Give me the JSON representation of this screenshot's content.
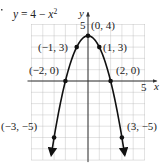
{
  "chart_data": {
    "type": "line",
    "equation": {
      "lhs": "y",
      "rhs_const": "4",
      "rhs_var": "x",
      "rhs_exp": "2"
    },
    "xlabel": "x",
    "ylabel": "y",
    "xlim": [
      -5,
      5
    ],
    "ylim": [
      -7,
      5
    ],
    "grid": true,
    "x_tick_label": "5",
    "y_tick_label": "5",
    "series": [
      {
        "name": "y = 4 − x²",
        "function": "4 - x^2",
        "domain": [
          -3.25,
          3.25
        ],
        "arrows_both_ends": true,
        "points": [
          {
            "x": -3,
            "y": -5,
            "label": "(−3, −5)"
          },
          {
            "x": -2,
            "y": 0,
            "label": "(−2, 0)"
          },
          {
            "x": -1,
            "y": 3,
            "label": "(−1, 3)"
          },
          {
            "x": 0,
            "y": 4,
            "label": "(0, 4)"
          },
          {
            "x": 1,
            "y": 3,
            "label": "(1, 3)"
          },
          {
            "x": 2,
            "y": 0,
            "label": "(2, 0)"
          },
          {
            "x": 3,
            "y": -5,
            "label": "(3, −5)"
          }
        ]
      }
    ]
  },
  "colors": {
    "curve": "#111111",
    "axis": "#333333",
    "grid": "#b8b8b8",
    "text": "#222222"
  }
}
